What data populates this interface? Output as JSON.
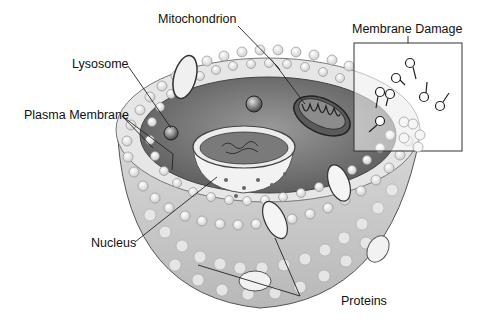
{
  "diagram": {
    "labels": {
      "mitochondrion": "Mitochondrion",
      "lysosome": "Lysosome",
      "plasma_membrane": "Plasma Membrane",
      "membrane_damage": "Membrane Damage",
      "nucleus": "Nucleus",
      "proteins": "Proteins"
    },
    "colors": {
      "background": "#ffffff",
      "line": "#222222",
      "text": "#111111",
      "cytoplasm": "#8a8a8a",
      "membrane_head": "#f4f4f4"
    }
  }
}
